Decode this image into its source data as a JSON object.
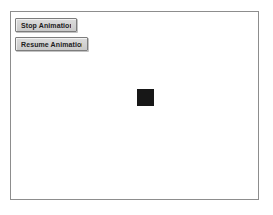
{
  "app": {
    "title": "Animation Applet",
    "background_color": "#ffffff"
  },
  "panel": {
    "border_color": "#8d8d8d",
    "background_color": "#ffffff",
    "x": 10,
    "y": 11,
    "width": 249,
    "height": 189
  },
  "controls": {
    "buttons": [
      {
        "name": "stop-animation-button",
        "label": "Stop Animation",
        "face_color": "#d3d3d3",
        "border_color": "#7d7d7d",
        "text_color": "#1c1c1c"
      },
      {
        "name": "resume-animation-button",
        "label": "Resume Animation",
        "face_color": "#d3d3d3",
        "border_color": "#7d7d7d",
        "text_color": "#1c1c1c"
      }
    ]
  },
  "canvas": {
    "shape": {
      "name": "animated-square",
      "type": "square",
      "color": "#171717",
      "size": 17,
      "x": 126,
      "y": 77
    }
  }
}
